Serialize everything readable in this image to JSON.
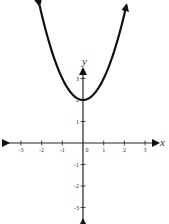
{
  "chart_data": {
    "type": "line",
    "title": "",
    "function": "y = x^2 + 2",
    "xlabel": "x",
    "ylabel": "y",
    "xlim": [
      -3,
      3
    ],
    "ylim": [
      -3,
      3
    ],
    "x_ticks": [
      -3,
      -2,
      -1,
      0,
      1,
      2,
      3
    ],
    "y_ticks": [
      -3,
      -2,
      -1,
      1,
      2,
      3
    ],
    "x_tick_labels": [
      "-3",
      "-2",
      "-1",
      "0",
      "1",
      "2",
      "3"
    ],
    "y_tick_labels": [
      "-3",
      "-2",
      "-1",
      "1",
      "2",
      "3"
    ],
    "series": [
      {
        "name": "parabola",
        "x": [
          -2.1,
          -1.75,
          -1.5,
          -1.25,
          -1,
          -0.75,
          -0.5,
          -0.25,
          0,
          0.25,
          0.5,
          0.75,
          1,
          1.25,
          1.5,
          1.75,
          2.1
        ],
        "y": [
          6.41,
          5.06,
          4.25,
          3.56,
          3,
          2.56,
          2.25,
          2.06,
          2,
          2.06,
          2.25,
          2.56,
          3,
          3.56,
          4.25,
          5.06,
          6.41
        ]
      }
    ],
    "vertex": [
      0,
      2
    ],
    "grid": false,
    "arrows_on_axes": true,
    "arrows_on_curve": true
  },
  "colors": {
    "axis": "#222222",
    "curve": "#111111",
    "tick_label": "#333333"
  }
}
